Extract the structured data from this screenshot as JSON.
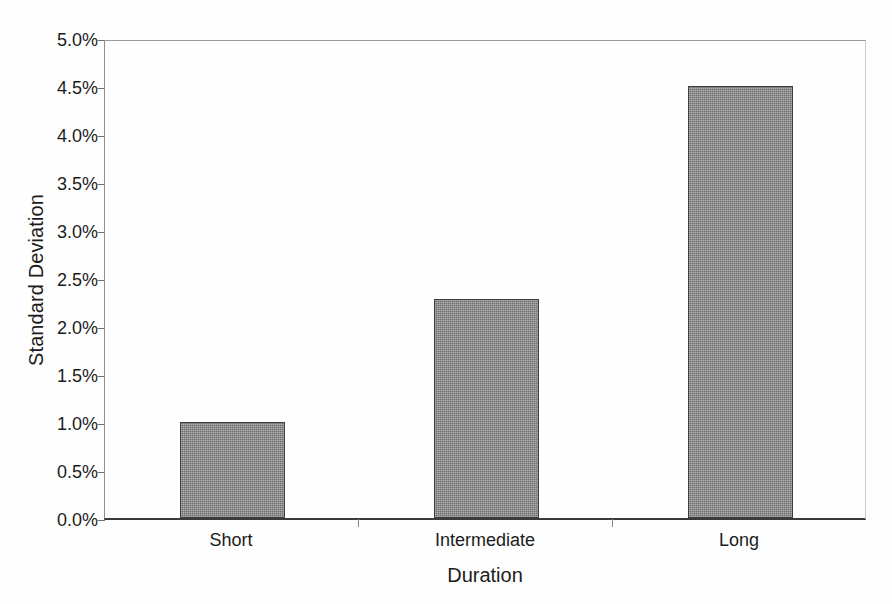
{
  "chart_data": {
    "type": "bar",
    "title": "",
    "subtitle": "",
    "xlabel": "Duration",
    "ylabel": "Standard Deviation",
    "categories": [
      "Short",
      "Intermediate",
      "Long"
    ],
    "values": [
      1.0,
      2.28,
      4.5
    ],
    "value_labels": [
      "1.0%",
      "2.28%",
      "4.5%"
    ],
    "unit": "%",
    "ylim": [
      0.0,
      5.0
    ],
    "ytick_values": [
      0.0,
      0.5,
      1.0,
      1.5,
      2.0,
      2.5,
      3.0,
      3.5,
      4.0,
      4.5,
      5.0
    ],
    "ytick_labels": [
      "0.0%",
      "0.5%",
      "1.0%",
      "1.5%",
      "2.0%",
      "2.5%",
      "3.0%",
      "3.5%",
      "4.0%",
      "4.5%",
      "5.0%"
    ],
    "grid": false,
    "legend": false,
    "legend_position": "none",
    "bar_fill_color": "#8c8c8c",
    "bar_border_color": "#3d3d3d",
    "axis_color": "#3a3a3a",
    "background_color": "#fefefe",
    "series": [
      {
        "name": "Standard Deviation",
        "values": [
          1.0,
          2.28,
          4.5
        ]
      }
    ]
  },
  "axes": {
    "y_title": "Standard Deviation",
    "x_title": "Duration"
  }
}
